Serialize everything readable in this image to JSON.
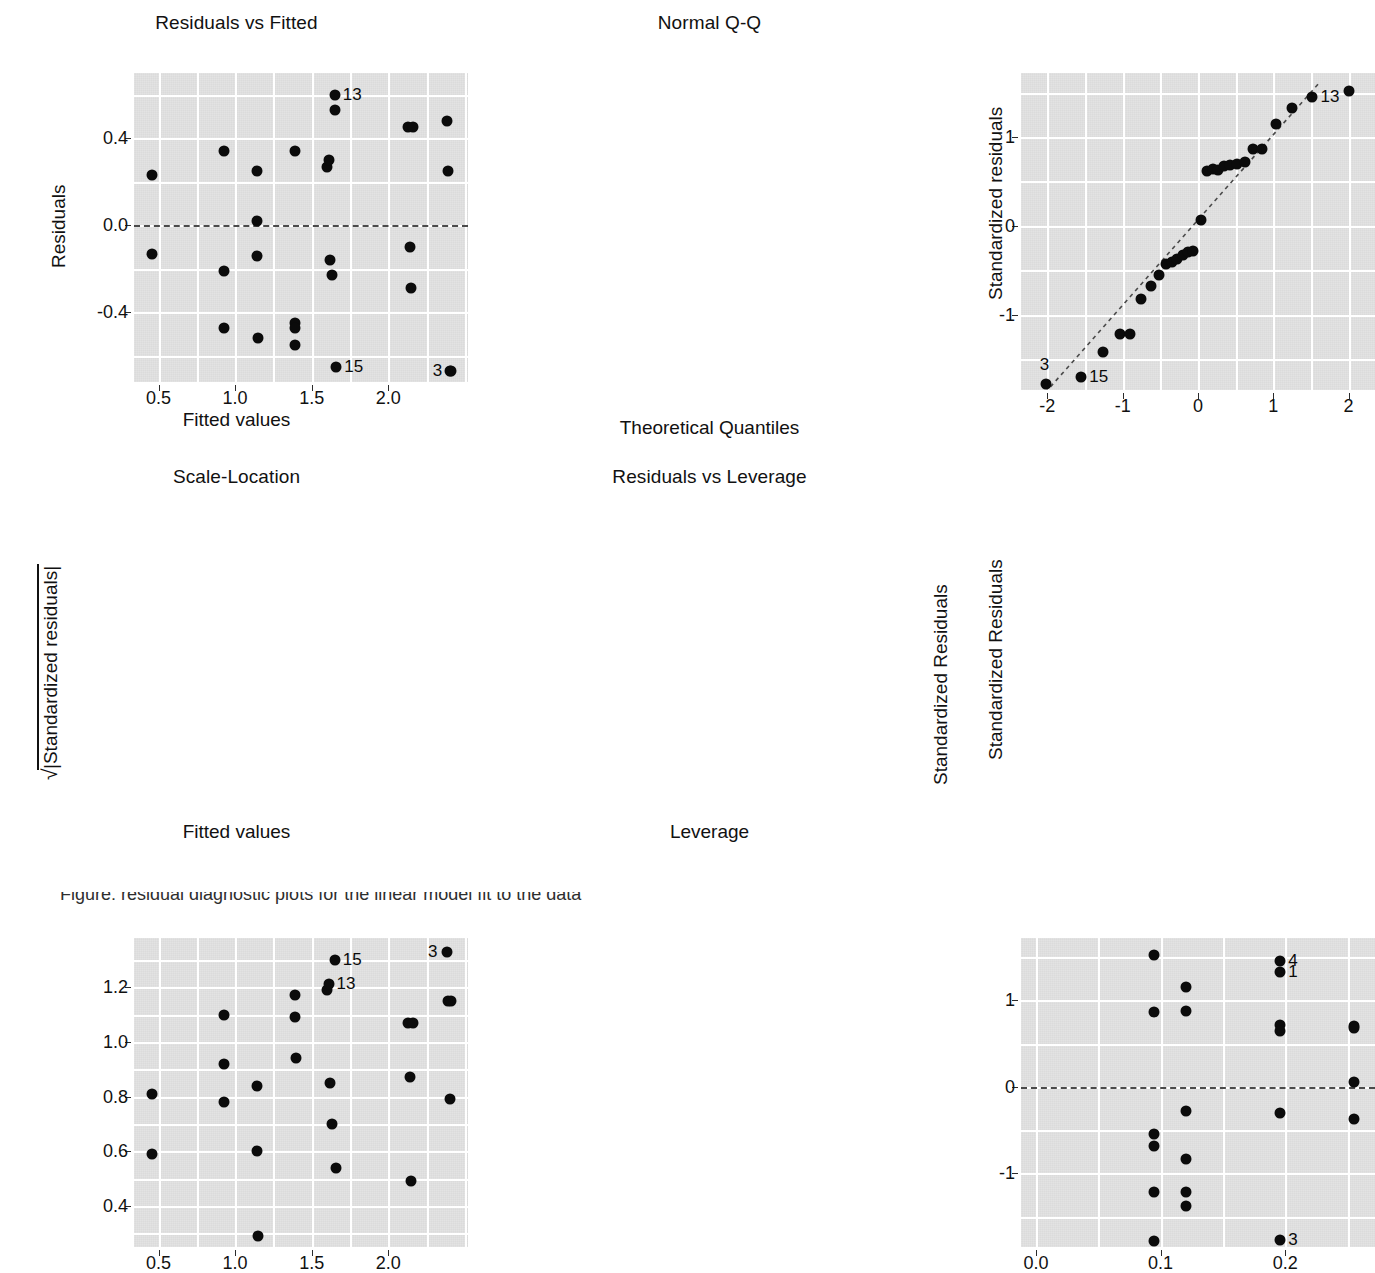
{
  "figure": {
    "kind": "regression-diagnostic-plots",
    "layout": "2x2",
    "background": "#ffffff",
    "panel_background": "#e3e3e3",
    "grid_color": "#ffffff",
    "point_color": "#0b0b0b",
    "reference_line_color": "#4a4a4a",
    "caption_partial": "Figure: residual diagnostic plots for the linear model fit to the data"
  },
  "chart_data": [
    {
      "id": "residuals-vs-fitted",
      "type": "scatter",
      "title": "Residuals vs Fitted",
      "xlabel": "Fitted values",
      "ylabel": "Residuals",
      "xlim": [
        0.34,
        2.52
      ],
      "ylim": [
        -0.72,
        0.7
      ],
      "xticks": [
        0.5,
        1.0,
        1.5,
        2.0
      ],
      "xticklabels": [
        "0.5",
        "1.0",
        "1.5",
        "2.0"
      ],
      "yticks": [
        0.4,
        0.0,
        -0.4
      ],
      "yticklabels": [
        "0.4",
        "0.0",
        "-0.4"
      ],
      "grid": true,
      "reference_line": {
        "type": "horizontal-dashed",
        "y": 0.0
      },
      "x": [
        0.46,
        0.46,
        0.93,
        0.93,
        0.93,
        1.14,
        1.14,
        1.14,
        1.15,
        1.39,
        1.39,
        1.39,
        1.39,
        1.6,
        1.61,
        1.62,
        1.63,
        1.65,
        1.65,
        1.66,
        2.13,
        2.14,
        2.15,
        2.16,
        2.38,
        2.39,
        2.4,
        2.41
      ],
      "y": [
        0.23,
        -0.13,
        0.34,
        -0.21,
        -0.47,
        0.25,
        0.02,
        -0.14,
        -0.52,
        0.34,
        -0.45,
        -0.55,
        -0.47,
        0.27,
        0.3,
        -0.16,
        -0.23,
        0.6,
        0.53,
        -0.65,
        0.45,
        -0.1,
        -0.29,
        0.45,
        0.48,
        0.25,
        -0.67,
        -0.67
      ],
      "annotations": [
        {
          "label": "13",
          "x": 1.65,
          "y": 0.6,
          "side": "right"
        },
        {
          "label": "15",
          "x": 1.66,
          "y": -0.65,
          "side": "right"
        },
        {
          "label": "3",
          "x": 2.41,
          "y": -0.67,
          "side": "left"
        }
      ]
    },
    {
      "id": "normal-qq",
      "type": "scatter",
      "title": "Normal Q-Q",
      "xlabel": "Theoretical Quantiles",
      "ylabel": "Standardized residuals",
      "xlim": [
        -2.35,
        2.35
      ],
      "ylim": [
        -1.85,
        1.72
      ],
      "xticks": [
        -2,
        -1,
        0,
        1,
        2
      ],
      "xticklabels": [
        "-2",
        "-1",
        "0",
        "1",
        "2"
      ],
      "yticks": [
        1,
        0,
        -1
      ],
      "yticklabels": [
        "1",
        "0",
        "-1"
      ],
      "grid": true,
      "reference_line": {
        "type": "qq-dashed",
        "x0": -2.1,
        "y0": -1.95,
        "x1": 1.62,
        "y1": 1.62
      },
      "x": [
        -2.02,
        -1.55,
        -1.26,
        -1.04,
        -0.9,
        -0.76,
        -0.63,
        -0.52,
        -0.42,
        -0.35,
        -0.28,
        -0.2,
        -0.13,
        -0.06,
        0.04,
        0.12,
        0.2,
        0.27,
        0.35,
        0.43,
        0.52,
        0.62,
        0.73,
        0.85,
        1.03,
        1.25,
        1.52,
        2.01
      ],
      "y": [
        -1.78,
        -1.7,
        -1.42,
        -1.22,
        -1.22,
        -0.83,
        -0.68,
        -0.55,
        -0.43,
        -0.41,
        -0.38,
        -0.33,
        -0.3,
        -0.28,
        0.06,
        0.62,
        0.64,
        0.63,
        0.67,
        0.68,
        0.7,
        0.72,
        0.86,
        0.86,
        1.15,
        1.33,
        1.45,
        1.52
      ],
      "annotations": [
        {
          "label": "13",
          "x": 1.52,
          "y": 1.45,
          "side": "right"
        },
        {
          "label": "15",
          "x": -1.55,
          "y": -1.7,
          "side": "right"
        },
        {
          "label": "3",
          "x": -2.02,
          "y": -1.78,
          "side": "above"
        }
      ]
    },
    {
      "id": "scale-location",
      "type": "scatter",
      "title": "Scale-Location",
      "xlabel": "Fitted values",
      "ylabel": "sqrt(|Standardized residuals|)",
      "ylabel_right": "Standardized Residuals",
      "xlim": [
        0.34,
        2.52
      ],
      "ylim": [
        0.25,
        1.38
      ],
      "xticks": [
        0.5,
        1.0,
        1.5,
        2.0
      ],
      "xticklabels": [
        "0.5",
        "1.0",
        "1.5",
        "2.0"
      ],
      "yticks": [
        1.2,
        1.0,
        0.8,
        0.6,
        0.4
      ],
      "yticklabels": [
        "1.2",
        "1.0",
        "0.8",
        "0.6",
        "0.4"
      ],
      "grid": true,
      "x": [
        0.46,
        0.46,
        0.93,
        0.93,
        0.93,
        1.14,
        1.14,
        1.15,
        1.39,
        1.39,
        1.4,
        1.6,
        1.61,
        1.62,
        1.63,
        1.65,
        1.66,
        2.13,
        2.14,
        2.15,
        2.16,
        2.38,
        2.39,
        2.4,
        2.41
      ],
      "y": [
        0.81,
        0.59,
        1.1,
        0.92,
        0.78,
        0.84,
        0.6,
        0.29,
        1.17,
        1.09,
        0.94,
        1.19,
        1.21,
        0.85,
        0.7,
        1.3,
        0.54,
        1.07,
        0.87,
        0.49,
        1.07,
        1.33,
        1.15,
        0.79,
        1.15
      ],
      "annotations": [
        {
          "label": "15",
          "x": 1.65,
          "y": 1.3,
          "side": "right"
        },
        {
          "label": "13",
          "x": 1.61,
          "y": 1.21,
          "side": "right"
        },
        {
          "label": "3",
          "x": 2.38,
          "y": 1.33,
          "side": "left"
        }
      ]
    },
    {
      "id": "residuals-vs-leverage",
      "type": "scatter",
      "title": "Residuals vs Leverage",
      "xlabel": "Leverage",
      "ylabel": "Standardized Residuals",
      "xlim": [
        -0.012,
        0.272
      ],
      "ylim": [
        -1.85,
        1.72
      ],
      "xticks": [
        0.0,
        0.1,
        0.2
      ],
      "xticklabels": [
        "0.0",
        "0.1",
        "0.2"
      ],
      "yticks": [
        1,
        0,
        -1
      ],
      "yticklabels": [
        "1",
        "0",
        "-1"
      ],
      "grid": true,
      "reference_line": {
        "type": "horizontal-dashed",
        "y": 0.0
      },
      "x": [
        0.095,
        0.095,
        0.095,
        0.095,
        0.095,
        0.095,
        0.12,
        0.12,
        0.12,
        0.12,
        0.12,
        0.12,
        0.196,
        0.196,
        0.196,
        0.196,
        0.196,
        0.196,
        0.255,
        0.255,
        0.255,
        0.255
      ],
      "y": [
        1.52,
        0.86,
        -0.55,
        -0.68,
        -1.22,
        -1.78,
        1.15,
        0.88,
        -0.28,
        -0.83,
        -1.22,
        -1.38,
        1.46,
        1.33,
        0.72,
        0.64,
        -0.3,
        -1.77,
        0.7,
        0.06,
        -0.37,
        0.68
      ],
      "annotations": [
        {
          "label": "4",
          "x": 0.196,
          "y": 1.46,
          "side": "right"
        },
        {
          "label": "1",
          "x": 0.196,
          "y": 1.33,
          "side": "right"
        },
        {
          "label": "3",
          "x": 0.196,
          "y": -1.77,
          "side": "right"
        }
      ]
    }
  ]
}
